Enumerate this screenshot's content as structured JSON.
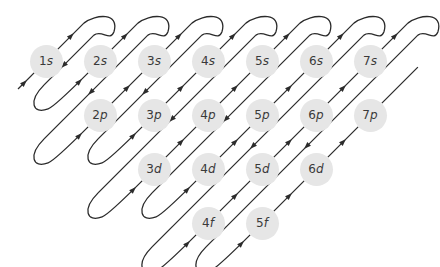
{
  "diagram": {
    "type": "aufbau-filling-order",
    "line_color": "#2b2b2b",
    "circle_color": "#e6e6e6",
    "orbitals": [
      {
        "n": "1",
        "l": "s",
        "col": 1,
        "row": 0
      },
      {
        "n": "2",
        "l": "s",
        "col": 2,
        "row": 0
      },
      {
        "n": "3",
        "l": "s",
        "col": 3,
        "row": 0
      },
      {
        "n": "4",
        "l": "s",
        "col": 4,
        "row": 0
      },
      {
        "n": "5",
        "l": "s",
        "col": 5,
        "row": 0
      },
      {
        "n": "6",
        "l": "s",
        "col": 6,
        "row": 0
      },
      {
        "n": "7",
        "l": "s",
        "col": 7,
        "row": 0
      },
      {
        "n": "2",
        "l": "p",
        "col": 2,
        "row": 1
      },
      {
        "n": "3",
        "l": "p",
        "col": 3,
        "row": 1
      },
      {
        "n": "4",
        "l": "p",
        "col": 4,
        "row": 1
      },
      {
        "n": "5",
        "l": "p",
        "col": 5,
        "row": 1
      },
      {
        "n": "6",
        "l": "p",
        "col": 6,
        "row": 1
      },
      {
        "n": "7",
        "l": "p",
        "col": 7,
        "row": 1
      },
      {
        "n": "3",
        "l": "d",
        "col": 3,
        "row": 2
      },
      {
        "n": "4",
        "l": "d",
        "col": 4,
        "row": 2
      },
      {
        "n": "5",
        "l": "d",
        "col": 5,
        "row": 2
      },
      {
        "n": "6",
        "l": "d",
        "col": 6,
        "row": 2
      },
      {
        "n": "4",
        "l": "f",
        "col": 4,
        "row": 3
      },
      {
        "n": "5",
        "l": "f",
        "col": 5,
        "row": 3
      }
    ],
    "filling_order": [
      "1s",
      "2s",
      "2p",
      "3s",
      "3p",
      "4s",
      "3d",
      "4p",
      "5s",
      "4d",
      "5p",
      "6s",
      "4f",
      "5d",
      "6p",
      "7s",
      "5f",
      "6d",
      "7p"
    ]
  }
}
